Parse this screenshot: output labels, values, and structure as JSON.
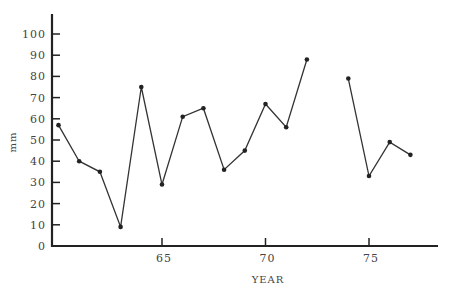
{
  "chart_data": {
    "type": "line",
    "title": "",
    "xlabel": "YEAR",
    "ylabel": "mm",
    "xlim": [
      59.7,
      78.2
    ],
    "ylim": [
      0,
      108
    ],
    "x_ticks": [
      65,
      70,
      75
    ],
    "x_tick_labels": [
      "65",
      "70",
      "75"
    ],
    "y_ticks": [
      0,
      10,
      20,
      30,
      40,
      50,
      60,
      70,
      80,
      90,
      100
    ],
    "y_tick_labels": [
      "0",
      "10",
      "20",
      "30",
      "40",
      "50",
      "60",
      "70",
      "80",
      "90",
      "100"
    ],
    "grid": false,
    "legend": null,
    "series": [
      {
        "name": "mm",
        "segments": [
          {
            "x": [
              60,
              61,
              62,
              63,
              64,
              65,
              66,
              67,
              68,
              69,
              70,
              71,
              72
            ],
            "y": [
              57,
              40,
              35,
              9,
              75,
              29,
              61,
              65,
              36,
              45,
              67,
              56,
              88
            ]
          },
          {
            "x": [
              74,
              75,
              76,
              77
            ],
            "y": [
              79,
              33,
              49,
              43
            ]
          }
        ]
      }
    ],
    "annotations": [
      "No data for year 73 (gap in line)"
    ]
  }
}
